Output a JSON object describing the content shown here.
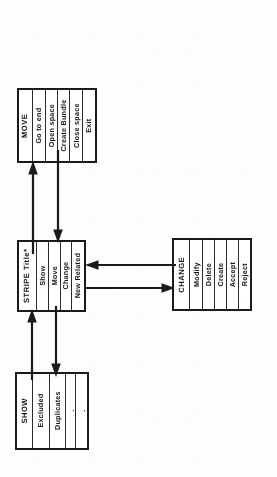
{
  "diagram": {
    "type": "menu-hierarchy-flowchart",
    "orientation": "rotated-90-ccw",
    "ink_color": "#1a1a1a",
    "paper_color": "#fdfdfc",
    "boxes": [
      {
        "id": "move",
        "name": "MOVE",
        "header": "MOVE",
        "items": [
          {
            "label": "Go to end"
          },
          {
            "label": "Open space"
          },
          {
            "label": "Create Bundle"
          },
          {
            "label": "Close space"
          },
          {
            "label": "Exit"
          }
        ]
      },
      {
        "id": "stripe",
        "name": "STRIPE Title*",
        "header": "STRIPE Title*",
        "items": [
          {
            "label": "Show"
          },
          {
            "label": "Move"
          },
          {
            "label": "Change"
          },
          {
            "label": "New Related"
          }
        ]
      },
      {
        "id": "change",
        "name": "CHANGE",
        "header": "CHANGE",
        "items": [
          {
            "label": "Modify"
          },
          {
            "label": "Delete"
          },
          {
            "label": "Create"
          },
          {
            "label": "Accept"
          },
          {
            "label": "Reject"
          }
        ]
      },
      {
        "id": "show",
        "name": "SHOW",
        "header": "SHOW",
        "items": [
          {
            "label": "Excluded"
          },
          {
            "label": "Duplicates"
          },
          {
            "label": "."
          },
          {
            "label": "."
          }
        ]
      }
    ],
    "connectors": [
      {
        "id": "stripe-to-move",
        "from": "stripe",
        "to": "move",
        "direction": "up"
      },
      {
        "id": "move-to-stripe",
        "from": "move",
        "to": "stripe",
        "direction": "down"
      },
      {
        "id": "show-to-stripe",
        "from": "show",
        "to": "stripe",
        "direction": "up"
      },
      {
        "id": "stripe-to-show",
        "from": "stripe",
        "to": "show",
        "direction": "down"
      },
      {
        "id": "change-to-stripe",
        "from": "change",
        "to": "stripe",
        "direction": "left"
      },
      {
        "id": "stripe-to-change",
        "from": "stripe",
        "to": "change",
        "direction": "right"
      }
    ]
  }
}
